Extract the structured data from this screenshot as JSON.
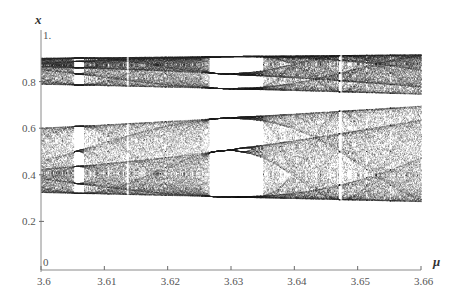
{
  "chart_data": {
    "type": "scatter",
    "xlabel": "μ",
    "ylabel": "x",
    "xlim": [
      3.6,
      3.66
    ],
    "ylim": [
      0,
      1
    ],
    "x_ticks": [
      3.6,
      3.61,
      3.62,
      3.63,
      3.64,
      3.65,
      3.66
    ],
    "x_tick_labels": [
      "3.6",
      "3.61",
      "3.62",
      "3.63",
      "3.64",
      "3.65",
      "3.66"
    ],
    "y_ticks": [
      0,
      0.2,
      0.4,
      0.6,
      0.8,
      1.0
    ],
    "y_tick_labels": [
      "0",
      "0.2",
      "0.4",
      "0.6",
      "0.8",
      "1."
    ],
    "grid": false,
    "legend": null,
    "bands": [
      {
        "name": "upper chaotic band",
        "x_range": [
          3.6,
          3.66
        ],
        "x_bottom_at_start": 0.8,
        "x_bottom_at_end": 0.765,
        "x_top": 0.92
      },
      {
        "name": "lower chaotic band",
        "x_range": [
          3.6,
          3.66
        ],
        "x_top_at_start": 0.61,
        "x_top_at_end": 0.7,
        "x_bottom_at_start": 0.32,
        "x_bottom_at_end": 0.29
      }
    ],
    "periodic_windows": [
      {
        "mu_start": 3.6053,
        "mu_end": 3.6068,
        "description": "narrow periodic window"
      },
      {
        "mu_start": 3.6266,
        "mu_end": 3.6349,
        "description": "period-6 window (period-3 within two bands)"
      }
    ],
    "thin_windows": [
      3.6137,
      3.6474
    ]
  },
  "axes": {
    "x_title": "μ",
    "y_title": "x"
  }
}
